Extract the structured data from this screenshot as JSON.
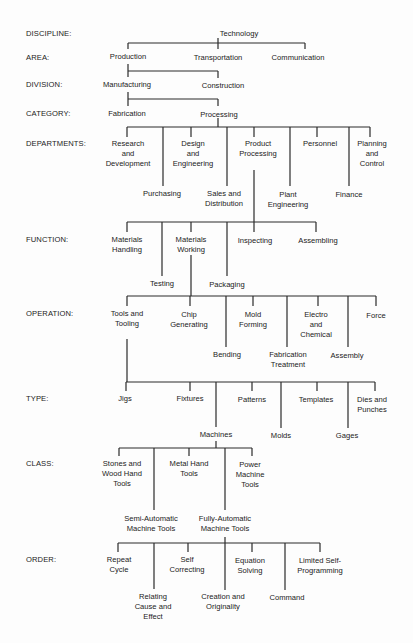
{
  "levels": [
    {
      "label": "DISCIPLINE:",
      "y": 29
    },
    {
      "label": "AREA:",
      "y": 53
    },
    {
      "label": "DIVISION:",
      "y": 80
    },
    {
      "label": "CATEGORY:",
      "y": 109
    },
    {
      "label": "DEPARTMENTS:",
      "y": 139
    },
    {
      "label": "FUNCTION:",
      "y": 235
    },
    {
      "label": "OPERATION:",
      "y": 309
    },
    {
      "label": "TYPE:",
      "y": 394
    },
    {
      "label": "CLASS:",
      "y": 459
    },
    {
      "label": "ORDER:",
      "y": 555
    }
  ],
  "nodes": [
    {
      "text": "Technology",
      "x": 239,
      "y": 29
    },
    {
      "text": "Production",
      "x": 128,
      "y": 52
    },
    {
      "text": "Transportation",
      "x": 218,
      "y": 53
    },
    {
      "text": "Communication",
      "x": 298,
      "y": 53
    },
    {
      "text": "Manufacturing",
      "x": 127,
      "y": 80
    },
    {
      "text": "Construction",
      "x": 223,
      "y": 81
    },
    {
      "text": "Fabrication",
      "x": 127,
      "y": 109
    },
    {
      "text": "Processing",
      "x": 219,
      "y": 110
    },
    {
      "text": "Research\nand\nDevelopment",
      "x": 128,
      "y": 139
    },
    {
      "text": "Design\nand\nEngineering",
      "x": 193,
      "y": 139
    },
    {
      "text": "Product\nProcessing",
      "x": 258,
      "y": 139
    },
    {
      "text": "Personnel",
      "x": 320,
      "y": 139
    },
    {
      "text": "Planning\nand\nControl",
      "x": 372,
      "y": 139
    },
    {
      "text": "Purchasing",
      "x": 162,
      "y": 189
    },
    {
      "text": "Sales and\nDistribution",
      "x": 224,
      "y": 189
    },
    {
      "text": "Plant\nEngineering",
      "x": 288,
      "y": 190
    },
    {
      "text": "Finance",
      "x": 349,
      "y": 190
    },
    {
      "text": "Materials\nHandling",
      "x": 127,
      "y": 235
    },
    {
      "text": "Materials\nWorking",
      "x": 191,
      "y": 235
    },
    {
      "text": "Inspecting",
      "x": 255,
      "y": 236
    },
    {
      "text": "Assembling",
      "x": 318,
      "y": 236
    },
    {
      "text": "Testing",
      "x": 162,
      "y": 279
    },
    {
      "text": "Packaging",
      "x": 227,
      "y": 280
    },
    {
      "text": "Tools and\nTooling",
      "x": 127,
      "y": 309
    },
    {
      "text": "Chip\nGenerating",
      "x": 189,
      "y": 310
    },
    {
      "text": "Mold\nForming",
      "x": 253,
      "y": 310
    },
    {
      "text": "Electro\nand\nChemical",
      "x": 316,
      "y": 310
    },
    {
      "text": "Force",
      "x": 376,
      "y": 311
    },
    {
      "text": "Bending",
      "x": 227,
      "y": 350
    },
    {
      "text": "Fabrication\nTreatment",
      "x": 288,
      "y": 350
    },
    {
      "text": "Assembly",
      "x": 347,
      "y": 351
    },
    {
      "text": "Jigs",
      "x": 125,
      "y": 394
    },
    {
      "text": "Fixtures",
      "x": 190,
      "y": 394
    },
    {
      "text": "Patterns",
      "x": 252,
      "y": 395
    },
    {
      "text": "Templates",
      "x": 316,
      "y": 395
    },
    {
      "text": "Dies and\nPunches",
      "x": 372,
      "y": 395
    },
    {
      "text": "Machines",
      "x": 216,
      "y": 430
    },
    {
      "text": "Molds",
      "x": 281,
      "y": 431
    },
    {
      "text": "Gages",
      "x": 347,
      "y": 431
    },
    {
      "text": "Stones and\nWood Hand\nTools",
      "x": 122,
      "y": 459
    },
    {
      "text": "Metal Hand\nTools",
      "x": 189,
      "y": 459
    },
    {
      "text": "Power\nMachine\nTools",
      "x": 250,
      "y": 460
    },
    {
      "text": "Semi-Automatic\nMachine Tools",
      "x": 151,
      "y": 514
    },
    {
      "text": "Fully-Automatic\nMachine Tools",
      "x": 225,
      "y": 514
    },
    {
      "text": "Repeat\nCycle",
      "x": 119,
      "y": 555
    },
    {
      "text": "Self\nCorrecting",
      "x": 187,
      "y": 555
    },
    {
      "text": "Equation\nSolving",
      "x": 250,
      "y": 556
    },
    {
      "text": "Limited Self-\nProgramming",
      "x": 320,
      "y": 556
    },
    {
      "text": "Relating\nCause and\nEffect",
      "x": 153,
      "y": 592
    },
    {
      "text": "Creation and\nOriginality",
      "x": 223,
      "y": 592
    },
    {
      "text": "Command",
      "x": 287,
      "y": 593
    }
  ],
  "lines": [
    [
      128,
      43,
      305,
      43
    ],
    [
      128,
      43,
      128,
      49
    ],
    [
      218,
      43,
      218,
      49
    ],
    [
      305,
      43,
      305,
      49
    ],
    [
      218,
      38,
      218,
      43
    ],
    [
      128,
      64,
      128,
      77
    ],
    [
      128,
      71,
      218,
      71
    ],
    [
      218,
      71,
      218,
      78
    ],
    [
      128,
      92,
      128,
      106
    ],
    [
      128,
      99,
      218,
      99
    ],
    [
      218,
      99,
      218,
      106
    ],
    [
      218,
      118,
      218,
      127
    ],
    [
      127,
      127,
      370,
      127
    ],
    [
      127,
      127,
      127,
      137
    ],
    [
      163,
      127,
      163,
      186
    ],
    [
      191,
      127,
      191,
      137
    ],
    [
      227,
      127,
      227,
      186
    ],
    [
      254,
      127,
      254,
      137
    ],
    [
      290,
      127,
      290,
      186
    ],
    [
      317,
      127,
      317,
      137
    ],
    [
      349,
      127,
      349,
      186
    ],
    [
      370,
      127,
      370,
      137
    ],
    [
      254,
      170,
      254,
      222
    ],
    [
      127,
      222,
      316,
      222
    ],
    [
      127,
      222,
      127,
      232
    ],
    [
      162,
      222,
      162,
      276
    ],
    [
      191,
      222,
      191,
      232
    ],
    [
      227,
      222,
      227,
      276
    ],
    [
      254,
      222,
      254,
      232
    ],
    [
      316,
      222,
      316,
      232
    ],
    [
      191,
      255,
      191,
      296
    ],
    [
      127,
      296,
      376,
      296
    ],
    [
      127,
      296,
      127,
      306
    ],
    [
      190,
      296,
      190,
      306
    ],
    [
      226,
      296,
      226,
      347
    ],
    [
      253,
      296,
      253,
      306
    ],
    [
      287,
      296,
      287,
      347
    ],
    [
      318,
      296,
      318,
      306
    ],
    [
      348,
      296,
      348,
      347
    ],
    [
      376,
      296,
      376,
      306
    ],
    [
      127,
      339,
      127,
      382
    ],
    [
      126,
      382,
      375,
      382
    ],
    [
      126,
      382,
      126,
      391
    ],
    [
      190,
      382,
      190,
      391
    ],
    [
      216,
      382,
      216,
      427
    ],
    [
      252,
      382,
      252,
      391
    ],
    [
      281,
      382,
      281,
      428
    ],
    [
      317,
      382,
      317,
      391
    ],
    [
      348,
      382,
      348,
      428
    ],
    [
      375,
      382,
      375,
      391
    ],
    [
      216,
      441,
      216,
      448
    ],
    [
      119,
      448,
      252,
      448
    ],
    [
      119,
      448,
      119,
      456
    ],
    [
      154,
      448,
      154,
      510
    ],
    [
      189,
      448,
      189,
      456
    ],
    [
      225,
      448,
      225,
      510
    ],
    [
      252,
      448,
      252,
      456
    ],
    [
      225,
      537,
      225,
      590
    ],
    [
      118,
      543,
      320,
      543
    ],
    [
      118,
      543,
      118,
      552
    ],
    [
      154,
      543,
      154,
      589
    ],
    [
      188,
      543,
      188,
      552
    ],
    [
      252,
      543,
      252,
      552
    ],
    [
      285,
      543,
      285,
      590
    ],
    [
      320,
      543,
      320,
      552
    ]
  ],
  "colors": {
    "background": "#fdfdfd",
    "ink": "#222222",
    "lines": "#2a2a2a"
  }
}
